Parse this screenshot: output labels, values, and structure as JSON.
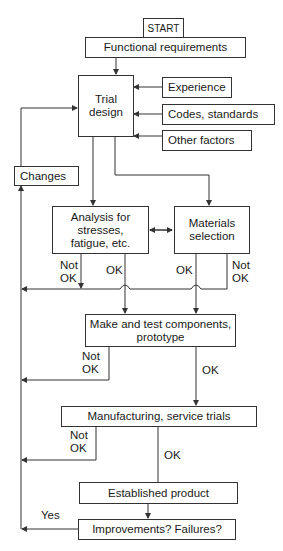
{
  "diagram": {
    "nodes": {
      "start": "START",
      "functional": "Functional requirements",
      "trial": "Trial\ndesign",
      "experience": "Experience",
      "codes": "Codes, standards",
      "other": "Other factors",
      "changes": "Changes",
      "analysis": "Analysis for\nstresses,\nfatigue, etc.",
      "materials": "Materials\nselection",
      "make_test": "Make and test components,\nprototype",
      "manufacturing": "Manufacturing, service trials",
      "established": "Established product",
      "improvements": "Improvements? Failures?"
    },
    "labels": {
      "analysis_not_ok": "Not\nOK",
      "analysis_ok": "OK",
      "materials_ok": "OK",
      "materials_not_ok": "Not\nOK",
      "make_not_ok": "Not\nOK",
      "make_ok": "OK",
      "manuf_not_ok": "Not\nOK",
      "manuf_ok": "OK",
      "yes": "Yes"
    },
    "line_color": "#333333"
  }
}
